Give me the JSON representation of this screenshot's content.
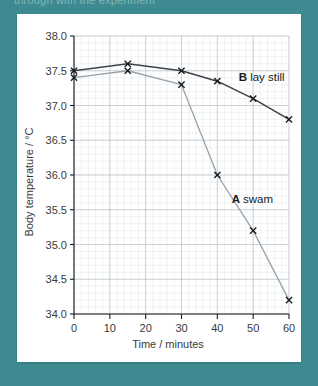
{
  "page": {
    "background_color": "#3d8b90",
    "card_background": "#ffffff",
    "cutoff_text": "through with the experiment"
  },
  "chart_data": {
    "type": "line",
    "title": "",
    "xlabel": "Time / minutes",
    "ylabel": "Body temperature / °C",
    "xlim": [
      0,
      60
    ],
    "ylim": [
      34.0,
      38.0
    ],
    "xticks": [
      "0",
      "10",
      "20",
      "30",
      "40",
      "50",
      "60"
    ],
    "xtick_values": [
      0,
      10,
      20,
      30,
      40,
      50,
      60
    ],
    "yticks": [
      "34.0",
      "34.5",
      "35.0",
      "35.5",
      "36.0",
      "36.5",
      "37.0",
      "37.5",
      "38.0"
    ],
    "ytick_values": [
      34.0,
      34.5,
      35.0,
      35.5,
      36.0,
      36.5,
      37.0,
      37.5,
      38.0
    ],
    "grid": true,
    "grid_minor": true,
    "legend_position": "inline-annotations",
    "x": [
      0,
      15,
      30,
      40,
      50,
      60
    ],
    "series": [
      {
        "name": "B lay still",
        "key": "B",
        "description": "lay still",
        "color": "#3c4248",
        "x": [
          0,
          15,
          30,
          40,
          50,
          60
        ],
        "values": [
          37.5,
          37.6,
          37.5,
          37.35,
          37.1,
          36.8
        ],
        "label_x": 46,
        "label_y": 37.35
      },
      {
        "name": "A swam",
        "key": "A",
        "description": "swam",
        "color": "#97a3ab",
        "x": [
          0,
          15,
          30,
          40,
          50,
          60
        ],
        "values": [
          37.4,
          37.5,
          37.3,
          36.0,
          35.2,
          34.2
        ],
        "label_x": 44,
        "label_y": 35.6
      }
    ]
  }
}
